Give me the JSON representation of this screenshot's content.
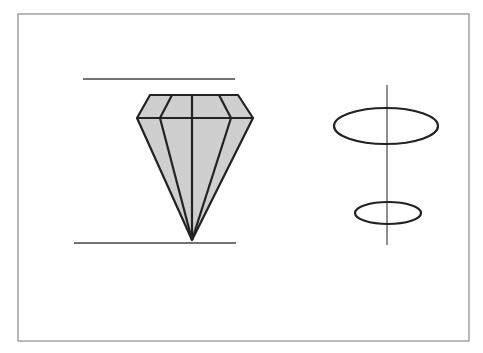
{
  "diagram": {
    "title": "",
    "frame": {
      "x": 18,
      "y": 14,
      "w": 451,
      "h": 327,
      "stroke": "#8a8a8a"
    },
    "colors": {
      "line": "#222222",
      "fill": "#cfcfcf",
      "guide": "#444444"
    },
    "diamond": {
      "table_y": 95,
      "girdle_y": 118,
      "culet": {
        "x": 192,
        "y": 240
      },
      "table_left_x": 150,
      "table_right_x": 238,
      "girdle_left_x": 137,
      "girdle_right_x": 253,
      "table_facets_x": [
        172,
        192,
        219
      ],
      "girdle_inner_x": [
        160,
        192,
        231
      ]
    },
    "guide_lines": [
      {
        "name": "top-guide-line",
        "x1": 83,
        "x2": 235,
        "y": 79
      },
      {
        "name": "bottom-guide-line",
        "x1": 74,
        "x2": 236,
        "y": 243
      }
    ],
    "axis": {
      "x": 387,
      "y1": 85,
      "y2": 245
    },
    "ellipses": [
      {
        "name": "large-ellipse",
        "cx": 386,
        "cy": 126,
        "rx": 52,
        "ry": 18
      },
      {
        "name": "small-ellipse",
        "cx": 388,
        "cy": 213,
        "rx": 33,
        "ry": 11
      }
    ]
  }
}
